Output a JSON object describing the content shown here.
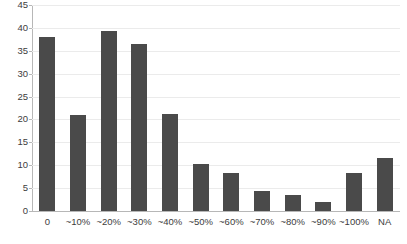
{
  "chart_data": {
    "type": "bar",
    "title": "",
    "subtitle": "",
    "xlabel": "",
    "ylabel": "",
    "categories": [
      "0",
      "~10%",
      "~20%",
      "~30%",
      "~40%",
      "~50%",
      "~60%",
      "~70%",
      "~80%",
      "~90%",
      "~100%",
      "NA"
    ],
    "values": [
      38,
      21,
      39.3,
      36.4,
      21.2,
      10.2,
      8.3,
      4.4,
      3.4,
      1.9,
      8.4,
      11.6
    ],
    "ylim": [
      0,
      45
    ],
    "ytick_interval": 5,
    "ytick_labels": [
      "0",
      "5",
      "10",
      "15",
      "20",
      "25",
      "30",
      "35",
      "40",
      "45"
    ],
    "grid": true,
    "legend": false,
    "legend_position": "none",
    "series": [
      {
        "name": "count",
        "values": [
          38,
          21,
          39.3,
          36.4,
          21.2,
          10.2,
          8.3,
          4.4,
          3.4,
          1.9,
          8.4,
          11.6
        ]
      }
    ]
  },
  "style": {
    "bar_color": "#4a4a4a",
    "gridline_color": "#ebebeb",
    "axis_color": "#b7b7b7",
    "text_color": "#3c3c3c",
    "background": "#ffffff"
  }
}
